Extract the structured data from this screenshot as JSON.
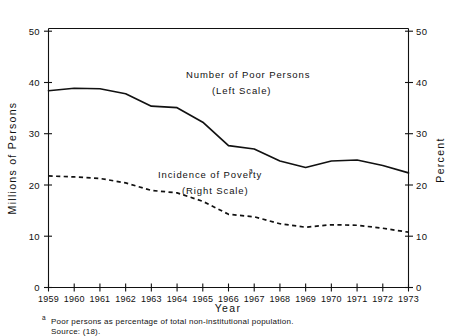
{
  "chart_data": {
    "type": "line",
    "title": "",
    "xlabel": "Year",
    "ylabel": "Millions of Persons",
    "ylabel_right": "Percent",
    "categories": [
      1959,
      1960,
      1961,
      1962,
      1963,
      1964,
      1965,
      1966,
      1967,
      1968,
      1969,
      1970,
      1971,
      1972,
      1973
    ],
    "xlim": [
      1959,
      1973
    ],
    "ylim": [
      0,
      52
    ],
    "ylim_right": [
      0,
      52
    ],
    "grid": false,
    "legend_position": "inline-annotation",
    "series": [
      {
        "name": "Number of Poor Persons",
        "scale": "left",
        "units": "millions",
        "style": "solid",
        "values": [
          39.5,
          40.0,
          39.9,
          38.9,
          36.4,
          36.1,
          33.2,
          28.5,
          27.8,
          25.4,
          24.1,
          25.4,
          25.6,
          24.5,
          23.0
        ]
      },
      {
        "name": "Incidence of Poverty",
        "scale": "right",
        "units": "percent",
        "style": "dashed",
        "values": [
          22.4,
          22.2,
          21.9,
          21.0,
          19.5,
          19.0,
          17.3,
          14.7,
          14.2,
          12.8,
          12.1,
          12.6,
          12.5,
          11.9,
          11.1
        ]
      }
    ],
    "annotations": [
      {
        "id": "solid-label-line1",
        "text": "Number of Poor Persons"
      },
      {
        "id": "solid-label-line2",
        "text": "(Left Scale)"
      },
      {
        "id": "dashed-label-line1",
        "text": "Incidence of Poverty"
      },
      {
        "id": "dashed-label-superscript",
        "text": "a"
      },
      {
        "id": "dashed-label-line2",
        "text": "(Right Scale)"
      }
    ],
    "yticks_left": [
      "0",
      "10",
      "20",
      "30",
      "40",
      "50"
    ],
    "yticks_right": [
      "0",
      "10",
      "20",
      "30",
      "40",
      "50"
    ],
    "xticks": [
      "1959",
      "1960",
      "1961",
      "1962",
      "1963",
      "1964",
      "1965",
      "1966",
      "1967",
      "1968",
      "1969",
      "1970",
      "1971",
      "1972",
      "1973"
    ],
    "colors": {
      "axis": "#111111",
      "series_solid": "#111111",
      "series_dashed": "#111111",
      "background": "#ffffff"
    }
  },
  "footnotes": {
    "marker": "a",
    "text": "Poor persons as percentage of total non-institutional population.",
    "source": "Source: (18)."
  }
}
